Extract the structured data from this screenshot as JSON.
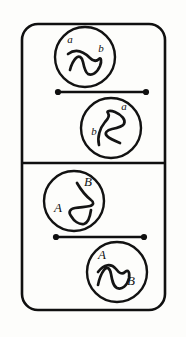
{
  "figure": {
    "background_color": "#fdfdfb",
    "ink_color": "#101010",
    "width": 186,
    "height": 337,
    "frame": {
      "x": 22,
      "y": 24,
      "width": 143,
      "height": 286,
      "corner_radius": 16,
      "stroke_width": 2.6
    },
    "divider": {
      "y": 163,
      "x1": 22,
      "x2": 165
    },
    "panels": [
      {
        "name": "upper-panel",
        "label_case": "lowercase",
        "tangles": [
          {
            "name": "upper-left-tangle",
            "cx": 85,
            "cy": 57,
            "r": 30,
            "labels": [
              {
                "text": "a",
                "x": 70,
                "y": 43
              },
              {
                "text": "b",
                "x": 101,
                "y": 52
              }
            ],
            "curve": "M 68 54 C 76 48, 84 52, 90 58 C 93 61, 96 62, 99 59 C 101 57, 102 61, 100 66 C 97 73, 92 76, 88 74 C 85 72, 84 67, 83 62 C 82 57, 79 55, 76 58 C 73 61, 71 66, 70 70"
          },
          {
            "name": "upper-right-tangle",
            "cx": 111,
            "cy": 128,
            "r": 30,
            "labels": [
              {
                "text": "a",
                "x": 124,
                "y": 110
              },
              {
                "text": "b",
                "x": 94,
                "y": 135
              }
            ],
            "curve": "M 99 145 C 97 137, 100 128, 105 122 C 108 119, 110 116, 108 113 C 106 111, 110 110, 115 112 C 122 115, 126 120, 124 124 C 122 127, 117 128, 112 129 C 107 130, 104 133, 107 136 C 110 139, 115 141, 120 143"
          }
        ],
        "bar": {
          "name": "upper-bar",
          "x1": 58,
          "x2": 146,
          "y": 92,
          "cap_radius": 3.1
        }
      },
      {
        "name": "lower-panel",
        "label_case": "uppercase",
        "tangles": [
          {
            "name": "lower-left-tangle",
            "cx": 74,
            "cy": 201,
            "r": 30,
            "labels": [
              {
                "text": "B",
                "x": 88,
                "y": 186
              },
              {
                "text": "A",
                "x": 58,
                "y": 212
              }
            ],
            "curve": "M 77 183 C 81 190, 86 196, 91 200 C 94 202, 94 205, 90 206 C 86 207, 80 207, 75 208 C 70 209, 68 212, 71 216 C 74 221, 79 225, 84 224 C 88 223, 90 217, 91 210"
          },
          {
            "name": "lower-right-tangle",
            "cx": 117,
            "cy": 272,
            "r": 30,
            "labels": [
              {
                "text": "A",
                "x": 102,
                "y": 259
              },
              {
                "text": "B",
                "x": 131,
                "y": 285
              }
            ],
            "curve": "M 98 272 C 104 264, 111 263, 116 269 C 119 273, 122 275, 125 272 C 128 269, 130 272, 129 278 C 127 286, 122 290, 117 288 C 113 286, 112 280, 111 274 C 110 268, 107 266, 104 270 C 101 274, 99 280, 98 285"
          }
        ],
        "bar": {
          "name": "lower-bar",
          "x1": 56,
          "x2": 144,
          "y": 237,
          "cap_radius": 3.1
        }
      }
    ]
  }
}
